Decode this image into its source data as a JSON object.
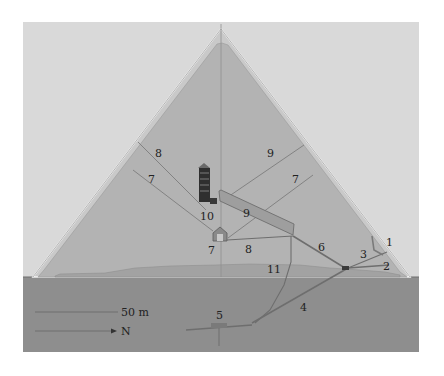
{
  "diagram": {
    "colors": {
      "sky": "#d9d9d9",
      "pyramid_fill": "#b3b3b3",
      "casing_line": "#f2f2f2",
      "bedrock": "#8c8c8c",
      "passage": "#7a7a7a",
      "chamber_dark": "#2e2e2e",
      "label_text": "#222222"
    },
    "labels": [
      {
        "id": "1",
        "text": "1",
        "x": 385,
        "y": 268
      },
      {
        "id": "2",
        "text": "2",
        "x": 382,
        "y": 270
      },
      {
        "id": "3",
        "text": "3",
        "x": 362,
        "y": 257
      },
      {
        "id": "4",
        "text": "4",
        "x": 301,
        "y": 310
      },
      {
        "id": "5",
        "text": "5",
        "x": 218,
        "y": 319
      },
      {
        "id": "6",
        "text": "6",
        "x": 320,
        "y": 250
      },
      {
        "id": "7a",
        "text": "7",
        "x": 151,
        "y": 181
      },
      {
        "id": "7b",
        "text": "7",
        "x": 294,
        "y": 181
      },
      {
        "id": "7c",
        "text": "7",
        "x": 211,
        "y": 252
      },
      {
        "id": "8",
        "text": "8",
        "x": 248,
        "y": 250
      },
      {
        "id": "9",
        "text": "9",
        "x": 247,
        "y": 217
      },
      {
        "id": "10a",
        "text": "10",
        "x": 157,
        "y": 156
      },
      {
        "id": "10b",
        "text": "10",
        "x": 268,
        "y": 156
      },
      {
        "id": "10c",
        "text": "10",
        "x": 202,
        "y": 219
      },
      {
        "id": "11",
        "text": "11",
        "x": 270,
        "y": 272
      }
    ],
    "scale_bar": {
      "label": "50 m",
      "length_px": 83
    },
    "direction": {
      "label": "N"
    }
  }
}
